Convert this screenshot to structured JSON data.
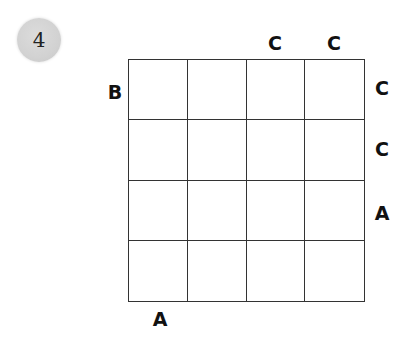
{
  "puzzle_number": "4",
  "grid": {
    "rows": 4,
    "cols": 4,
    "cells": [
      [
        "",
        "",
        "",
        ""
      ],
      [
        "",
        "",
        "",
        ""
      ],
      [
        "",
        "",
        "",
        ""
      ],
      [
        "",
        "",
        "",
        ""
      ]
    ]
  },
  "clues": {
    "top": [
      "",
      "",
      "C",
      "C"
    ],
    "right": [
      "C",
      "C",
      "A",
      ""
    ],
    "bottom": [
      "A",
      "",
      "",
      ""
    ],
    "left": [
      "B",
      "",
      "",
      ""
    ]
  },
  "colors": {
    "badge": "#d4d4d4",
    "grid_line": "#333333",
    "text": "#111111"
  }
}
